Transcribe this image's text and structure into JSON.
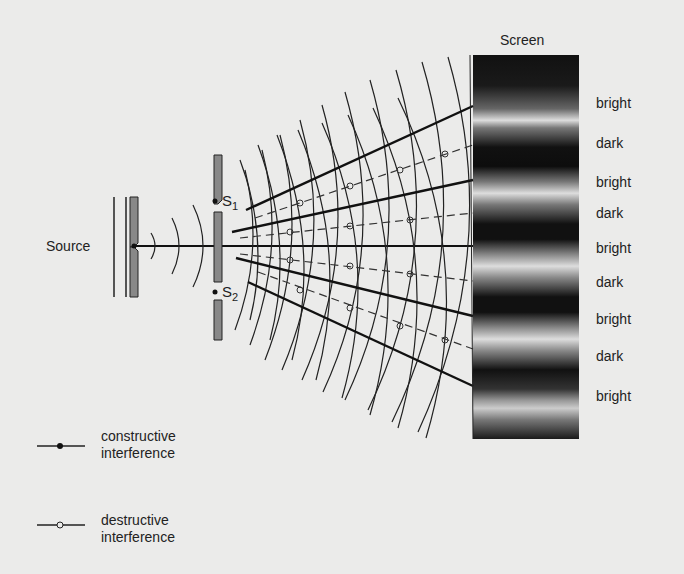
{
  "diagram": {
    "source_label": "Source",
    "slit1_label": "S",
    "slit1_sub": "1",
    "slit2_label": "S",
    "slit2_sub": "2",
    "screen_label": "Screen",
    "fringes": [
      "bright",
      "dark",
      "bright",
      "dark",
      "bright",
      "dark",
      "bright",
      "dark",
      "bright"
    ],
    "legend": [
      {
        "line1": "constructive",
        "line2": "interference",
        "marker": "filled-dot"
      },
      {
        "line1": "destructive",
        "line2": "interference",
        "marker": "open-circle"
      }
    ]
  }
}
